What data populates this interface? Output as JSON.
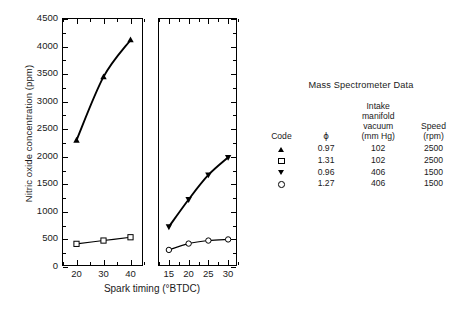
{
  "chart_data": {
    "type": "line",
    "title": "",
    "xlabel": "Spark timing (°BTDC)",
    "ylabel": "Nitric oxide concentration (ppm)",
    "ylim": [
      0,
      4500
    ],
    "ytick_values": [
      0,
      500,
      1000,
      1500,
      2000,
      2500,
      3000,
      3500,
      4000,
      4500
    ],
    "ytick_labels": [
      "0",
      "500",
      "1000",
      "1500",
      "2000",
      "2500",
      "3000",
      "3500",
      "4000",
      "4500"
    ],
    "yminor_step": 250,
    "grid": false,
    "legend_position": "right",
    "panels": [
      {
        "name": "left-panel",
        "xlim": [
          15,
          45
        ],
        "xtick_values": [
          20,
          30,
          40
        ],
        "xtick_labels": [
          "20",
          "30",
          "40"
        ],
        "xminor_step": 5,
        "series": [
          {
            "name": "phi 0.97, 102 mm Hg, 2500 rpm",
            "marker": "filled-triangle-up",
            "x": [
              20,
              30,
              40
            ],
            "values": [
              2300,
              3450,
              4120
            ]
          },
          {
            "name": "phi 1.31, 102 mm Hg, 2500 rpm",
            "marker": "open-square",
            "x": [
              20,
              30,
              40
            ],
            "values": [
              420,
              480,
              540
            ]
          }
        ]
      },
      {
        "name": "right-panel",
        "xlim": [
          12.5,
          32.5
        ],
        "xtick_values": [
          15,
          20,
          25,
          30
        ],
        "xtick_labels": [
          "15",
          "20",
          "25",
          "30"
        ],
        "xminor_step": 2.5,
        "series": [
          {
            "name": "phi 0.96, 406 mm Hg, 1500 rpm",
            "marker": "filled-triangle-down",
            "x": [
              15,
              20,
              25,
              30
            ],
            "values": [
              730,
              1225,
              1670,
              1990
            ]
          },
          {
            "name": "phi 1.27, 406 mm Hg, 1500 rpm",
            "marker": "open-circle",
            "x": [
              15,
              20,
              25,
              30
            ],
            "values": [
              310,
              425,
              480,
              500
            ]
          }
        ]
      }
    ]
  },
  "legend": {
    "title": "Mass Spectrometer Data",
    "headers": {
      "code": "Code",
      "phi": "ϕ",
      "vacuum_l1": "Intake",
      "vacuum_l2": "manifold",
      "vacuum_l3": "vacuum",
      "vacuum_l4": "(mm Hg)",
      "speed_l1": "Speed",
      "speed_l2": "(rpm)"
    },
    "rows": [
      {
        "marker": "filled-triangle-up",
        "phi": "0.97",
        "vacuum": "102",
        "speed": "2500"
      },
      {
        "marker": "open-square",
        "phi": "1.31",
        "vacuum": "102",
        "speed": "2500"
      },
      {
        "marker": "filled-triangle-down",
        "phi": "0.96",
        "vacuum": "406",
        "speed": "1500"
      },
      {
        "marker": "open-circle",
        "phi": "1.27",
        "vacuum": "406",
        "speed": "1500"
      }
    ]
  },
  "colors": {
    "ink": "#000000",
    "background": "#ffffff",
    "text": "#1a1a1a"
  }
}
